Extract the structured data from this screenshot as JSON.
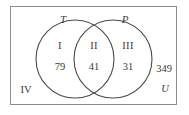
{
  "figure": {
    "type": "venn-diagram",
    "sets": 2,
    "universe_label": "U",
    "outside_count": "349",
    "colors": {
      "frame": "#8c8c8c",
      "circle": "#4a4a4a",
      "text": "#3a3a3a",
      "background": "#ffffff"
    },
    "set_labels": [
      {
        "name": "T",
        "text": "T"
      },
      {
        "name": "P",
        "text": "P"
      }
    ],
    "regions": [
      {
        "id": "I",
        "roman": "I",
        "count": "79",
        "description": "T only"
      },
      {
        "id": "II",
        "roman": "II",
        "count": "41",
        "description": "T and P"
      },
      {
        "id": "III",
        "roman": "III",
        "count": "31",
        "description": "P only"
      },
      {
        "id": "IV",
        "roman": "IV",
        "count": "349",
        "description": "outside both"
      }
    ]
  }
}
